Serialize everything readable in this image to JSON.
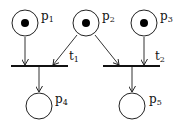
{
  "diagram": {
    "type": "petri-net",
    "places": [
      {
        "id": "p1",
        "label": "p",
        "sub": "1",
        "tokens": 1
      },
      {
        "id": "p2",
        "label": "p",
        "sub": "2",
        "tokens": 1
      },
      {
        "id": "p3",
        "label": "p",
        "sub": "3",
        "tokens": 1
      },
      {
        "id": "p4",
        "label": "p",
        "sub": "4",
        "tokens": 0
      },
      {
        "id": "p5",
        "label": "p",
        "sub": "5",
        "tokens": 0
      }
    ],
    "transitions": [
      {
        "id": "t1",
        "label": "t",
        "sub": "1"
      },
      {
        "id": "t2",
        "label": "t",
        "sub": "2"
      }
    ],
    "arcs": [
      {
        "from": "p1",
        "to": "t1"
      },
      {
        "from": "p2",
        "to": "t1"
      },
      {
        "from": "p2",
        "to": "t2"
      },
      {
        "from": "p3",
        "to": "t2"
      },
      {
        "from": "t1",
        "to": "p4"
      },
      {
        "from": "t2",
        "to": "p5"
      }
    ]
  }
}
